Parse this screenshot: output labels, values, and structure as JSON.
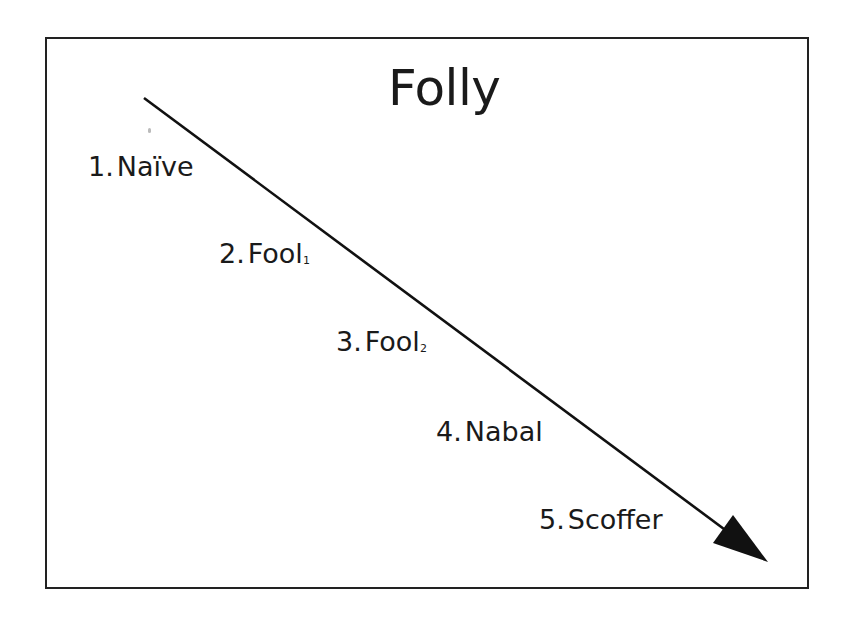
{
  "diagram": {
    "title": "Folly",
    "arrow": {
      "x1": 144,
      "y1": 98,
      "x2": 768,
      "y2": 562,
      "color": "#111111",
      "direction": "down-right"
    },
    "stages": [
      {
        "number": "1.",
        "label": "Naïve",
        "subscript": ""
      },
      {
        "number": "2.",
        "label": "Fool",
        "subscript": "1"
      },
      {
        "number": "3.",
        "label": "Fool",
        "subscript": "2"
      },
      {
        "number": "4.",
        "label": "Nabal",
        "subscript": ""
      },
      {
        "number": "5.",
        "label": "Scoffer",
        "subscript": ""
      }
    ],
    "colors": {
      "border": "#222222",
      "text": "#1a1a1a",
      "background": "#ffffff"
    }
  }
}
